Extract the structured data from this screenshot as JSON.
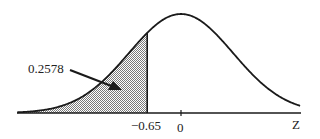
{
  "chart_data": {
    "type": "area",
    "title": "",
    "xlabel": "Z",
    "ylabel": "",
    "distribution": "standard normal",
    "shaded_region": {
      "from": "-inf",
      "to": -0.65,
      "area": 0.2578
    },
    "tick_labels": [
      "-0.65",
      "0"
    ],
    "ticks": [
      -0.65,
      0
    ],
    "annotations": [
      {
        "text": "0.2578",
        "points_to": "shaded area left of -0.65"
      }
    ],
    "xlim": [
      -3.5,
      3.5
    ],
    "grid": false,
    "legend": null
  },
  "labels": {
    "area_value": "0.2578",
    "tick_neg": "-0.65",
    "tick_zero": "0",
    "axis_name": "Z"
  },
  "colors": {
    "curve": "#1a1a1a",
    "shade": "#b5b5b5",
    "axis": "#1a1a1a"
  }
}
